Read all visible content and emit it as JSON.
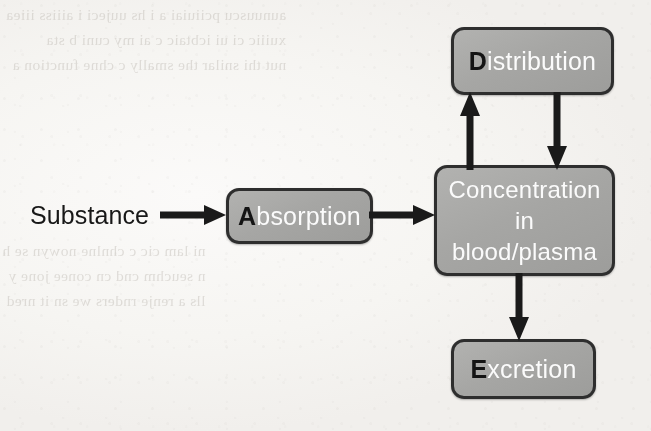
{
  "diagram": {
    "type": "flowchart",
    "background_color": "#f8f7f5",
    "node_fill_color": "#a8a8a6",
    "node_border_color": "#2e2e2e",
    "node_text_color": "#ffffff",
    "capital_letter_color": "#141414",
    "label_text_color": "#181818",
    "arrow_color": "#1a1a1a"
  },
  "label": {
    "substance": "Substance"
  },
  "nodes": {
    "absorption": {
      "capital": "A",
      "rest": "bsorption",
      "full_text": "Absorption"
    },
    "distribution": {
      "capital": "D",
      "rest": "istribution",
      "full_text": "Distribution"
    },
    "concentration": {
      "line1": "Concentration",
      "line2": "in",
      "line3": "blood/plasma",
      "full_text": "Concentration in blood/plasma"
    },
    "excretion": {
      "capital": "E",
      "rest": "xcretion",
      "full_text": "Excretion"
    }
  },
  "arrows": [
    {
      "name": "substance-to-absorption",
      "from": "Substance",
      "to": "Absorption",
      "direction": "right"
    },
    {
      "name": "absorption-to-concentration",
      "from": "Absorption",
      "to": "Concentration",
      "direction": "right"
    },
    {
      "name": "concentration-to-distribution",
      "from": "Concentration",
      "to": "Distribution",
      "direction": "up"
    },
    {
      "name": "distribution-to-concentration",
      "from": "Distribution",
      "to": "Concentration",
      "direction": "down"
    },
    {
      "name": "concentration-to-excretion",
      "from": "Concentration",
      "to": "Excretion",
      "direction": "down"
    }
  ],
  "background_bleedthrough": {
    "note": "faint mirrored show-through text from the reverse side of the scanned page; illegible",
    "top_lines": "aunuuscu pciiuiai a i hs uujeci i aiiiss iiiea\nxuiiic ci ui icbtaic c ai my cuni b sta\nnut thi snilar the smally c chne function a",
    "mid_lines": "ni lam cic c chnlne nowyn se h\nn seuchm cnd cn conee jone y\nlls a renje rnders we sn it nred"
  }
}
